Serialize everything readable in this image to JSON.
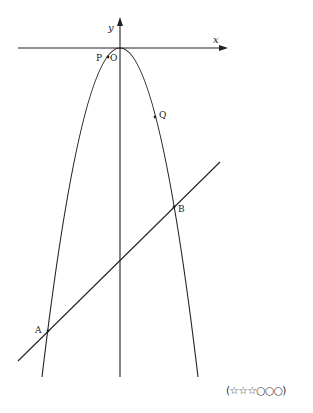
{
  "figure": {
    "axes": {
      "x_label": "x",
      "y_label": "y",
      "origin_label": "O"
    },
    "curve": {
      "type": "parabola",
      "opening": "down",
      "vertex": "O"
    },
    "line": {
      "type": "straight line",
      "intersections": [
        "A",
        "B"
      ]
    },
    "points": [
      {
        "name": "P",
        "on": "parabola"
      },
      {
        "name": "Q",
        "on": "parabola"
      },
      {
        "name": "A",
        "on": "parabola and line"
      },
      {
        "name": "B",
        "on": "parabola and line"
      }
    ]
  },
  "difficulty_rating": "(☆☆☆○○○)"
}
